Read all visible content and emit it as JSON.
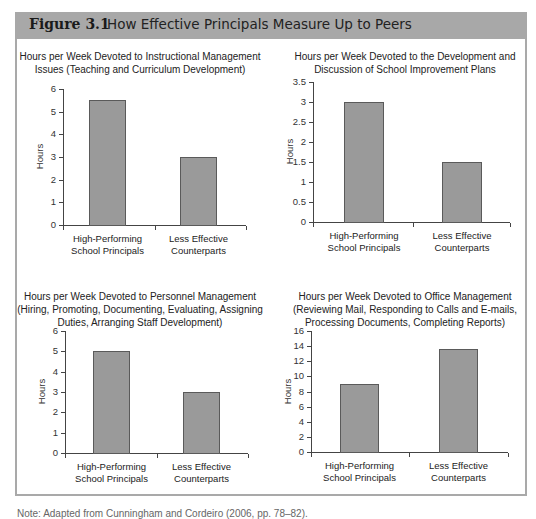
{
  "figure": {
    "number": "Figure 3.1",
    "title": "How Effective Principals Measure Up to Peers",
    "caption": "Note: Adapted from Cunningham and Cordeiro (2006, pp. 78–82)."
  },
  "colors": {
    "header_bg": "#a8a8a8",
    "bar_fill": "#9a9a9a",
    "frame": "#a9a9a9"
  },
  "chart_data": [
    {
      "type": "bar",
      "title": "Hours per Week Devoted to Instructional Management Issues (Teaching and Curriculum Development)",
      "title_lines": [
        "Hours per Week Devoted to Instructional Management",
        "Issues (Teaching and Curriculum Development)"
      ],
      "categories": [
        "High-Performing School Principals",
        "Less Effective Counterparts"
      ],
      "category_lines": [
        [
          "High-Performing",
          "School Principals"
        ],
        [
          "Less Effective",
          "Counterparts"
        ]
      ],
      "values": [
        5.5,
        3.0
      ],
      "xlabel": "",
      "ylabel": "Hours",
      "ylim": [
        0,
        6
      ],
      "yticks": [
        "0",
        "1",
        "2",
        "3",
        "4",
        "5",
        "6"
      ],
      "grid": false
    },
    {
      "type": "bar",
      "title": "Hours per Week Devoted to the Development and Discussion of School Improvement Plans",
      "title_lines": [
        "Hours per Week Devoted to the Development and",
        "Discussion of School Improvement Plans"
      ],
      "categories": [
        "High-Performing School Principals",
        "Less Effective Counterparts"
      ],
      "category_lines": [
        [
          "High-Performing",
          "School Principals"
        ],
        [
          "Less Effective",
          "Counterparts"
        ]
      ],
      "values": [
        3.0,
        1.5
      ],
      "xlabel": "",
      "ylabel": "Hours",
      "ylim": [
        0,
        3.5
      ],
      "yticks": [
        "0",
        "0.5",
        "1",
        "1.5",
        "2",
        "2.5",
        "3",
        "3.5"
      ],
      "grid": false
    },
    {
      "type": "bar",
      "title": "Hours per Week Devoted to Personnel Management (Hiring, Promoting, Documenting, Evaluating, Assigning Duties, Arranging Staff Development)",
      "title_lines": [
        "Hours per Week Devoted to Personnel Management",
        "(Hiring, Promoting, Documenting, Evaluating, Assigning",
        "Duties, Arranging Staff Development)"
      ],
      "categories": [
        "High-Performing School Principals",
        "Less Effective Counterparts"
      ],
      "category_lines": [
        [
          "High-Performing",
          "School Principals"
        ],
        [
          "Less Effective",
          "Counterparts"
        ]
      ],
      "values": [
        5.0,
        3.0
      ],
      "xlabel": "",
      "ylabel": "Hours",
      "ylim": [
        0,
        6
      ],
      "yticks": [
        "0",
        "1",
        "2",
        "3",
        "4",
        "5",
        "6"
      ],
      "grid": false
    },
    {
      "type": "bar",
      "title": "Hours per Week Devoted to Office Management (Reviewing Mail, Responding to Calls and E-mails, Processing Documents, Completing Reports)",
      "title_lines": [
        "Hours per Week Devoted to Office Management",
        "(Reviewing Mail, Responding to Calls and E-mails,",
        "Processing Documents, Completing Reports)"
      ],
      "categories": [
        "High-Performing School Principals",
        "Less Effective Counterparts"
      ],
      "category_lines": [
        [
          "High-Performing",
          "School Principals"
        ],
        [
          "Less Effective",
          "Counterparts"
        ]
      ],
      "values": [
        9.0,
        13.6
      ],
      "xlabel": "",
      "ylabel": "Hours",
      "ylim": [
        0,
        16
      ],
      "yticks": [
        "0",
        "2",
        "4",
        "6",
        "8",
        "10",
        "12",
        "14",
        "16"
      ],
      "grid": false
    }
  ]
}
